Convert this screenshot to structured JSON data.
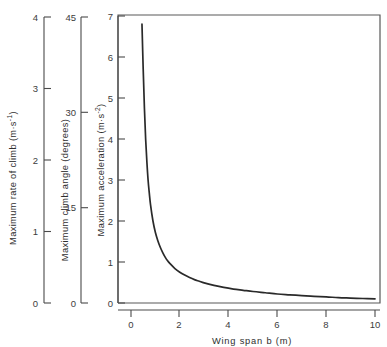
{
  "chart_data": {
    "type": "line",
    "title": "",
    "subtitle": "",
    "xlabel": "Wing span b (m)",
    "xlim": [
      0,
      10
    ],
    "xticks": [
      0,
      2,
      4,
      6,
      8,
      10
    ],
    "xticklabels": [
      "0",
      "2",
      "4",
      "6",
      "8",
      "10"
    ],
    "grid": false,
    "legend": null,
    "axes": [
      {
        "id": "rate-of-climb",
        "label": "Maximum rate of climb",
        "units": "(m·s⁻¹)",
        "label_full": "Maximum rate of climb (m·s⁻¹)",
        "ylim": [
          0,
          4
        ],
        "yticks": [
          0,
          1,
          2,
          3,
          4
        ],
        "yticklabels": [
          "0",
          "1",
          "2",
          "3",
          "4"
        ],
        "position": "outer-left",
        "unit_base": "m·s",
        "unit_exponent": "-1"
      },
      {
        "id": "climb-angle",
        "label": "Maximum climb angle",
        "units": "(degrees)",
        "label_full": "Maximum climb angle (degrees)",
        "ylim": [
          0,
          45
        ],
        "yticks": [
          0,
          15,
          30,
          45
        ],
        "yticklabels": [
          "0",
          "15",
          "30",
          "45"
        ],
        "position": "middle-left",
        "unit_base": "degrees",
        "unit_exponent": ""
      },
      {
        "id": "acceleration",
        "label": "Maximum acceleration",
        "units": "(m·s⁻²)",
        "label_full": "Maximum acceleration (m·s⁻²)",
        "ylim": [
          0,
          7
        ],
        "yticks": [
          0,
          1,
          2,
          3,
          4,
          5,
          6,
          7
        ],
        "yticklabels": [
          "0",
          "1",
          "2",
          "3",
          "4",
          "5",
          "6",
          "7"
        ],
        "position": "inner-left",
        "unit_base": "m·s",
        "unit_exponent": "-2"
      }
    ],
    "series": [
      {
        "name": "maximum acceleration vs wing span",
        "color": "#2a2a2a",
        "x": [
          0.45,
          0.5,
          0.55,
          0.6,
          0.65,
          0.7,
          0.75,
          0.8,
          0.9,
          1.0,
          1.1,
          1.2,
          1.3,
          1.4,
          1.5,
          1.6,
          1.8,
          2.0,
          2.2,
          2.4,
          2.6,
          2.8,
          3.0,
          3.4,
          3.8,
          4.2,
          4.6,
          5.0,
          5.5,
          6.0,
          6.5,
          7.0,
          7.5,
          8.0,
          8.5,
          9.0,
          9.5,
          10.0
        ],
        "y": [
          6.8,
          5.7,
          4.75,
          4.0,
          3.45,
          3.0,
          2.68,
          2.4,
          2.0,
          1.72,
          1.52,
          1.36,
          1.23,
          1.12,
          1.03,
          0.96,
          0.84,
          0.75,
          0.68,
          0.62,
          0.57,
          0.53,
          0.49,
          0.43,
          0.38,
          0.34,
          0.31,
          0.28,
          0.25,
          0.22,
          0.2,
          0.18,
          0.16,
          0.15,
          0.13,
          0.12,
          0.11,
          0.1
        ]
      }
    ]
  },
  "labels": {
    "axis1_part1": "Maximum rate of climb  (m·s",
    "axis1_part2": ")",
    "axis1_exp": "-1",
    "axis2_text": "Maximum climb angle (degrees)",
    "axis3_part1": "Maximum acceleration  (m·s",
    "axis3_part2": ")",
    "axis3_exp": "-2",
    "xaxis_text": "Wing span b (m)"
  },
  "ticklabels": {
    "a1": [
      "0",
      "1",
      "2",
      "3",
      "4"
    ],
    "a2": [
      "0",
      "15",
      "30",
      "45"
    ],
    "a3": [
      "0",
      "1",
      "2",
      "3",
      "4",
      "5",
      "6",
      "7"
    ],
    "x": [
      "0",
      "2",
      "4",
      "6",
      "8",
      "10"
    ]
  },
  "colors": {
    "curve": "#2a2a2a",
    "axis": "#4a4a4a",
    "frame": "#585858",
    "text": "#2e2e2e",
    "background": "#ffffff"
  }
}
